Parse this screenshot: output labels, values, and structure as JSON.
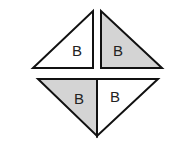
{
  "diagram": {
    "title": "",
    "colors": {
      "stroke": "#111111",
      "shaded": "#d4d4d4",
      "unshaded": "#ffffff"
    },
    "triangles": [
      {
        "position": "top-left",
        "label": "B",
        "shaded": false,
        "points": "93,11 93,68 33,68",
        "label_x": 72,
        "label_y": 56
      },
      {
        "position": "top-right",
        "label": "B",
        "shaded": true,
        "points": "101,11 101,68 162,68",
        "label_x": 113,
        "label_y": 56
      },
      {
        "position": "bottom-left",
        "label": "B",
        "shaded": true,
        "points": "38,79 97,79 97,136",
        "label_x": 74,
        "label_y": 104
      },
      {
        "position": "bottom-right",
        "label": "B",
        "shaded": false,
        "points": "97,79 158,79 97,136",
        "label_x": 110,
        "label_y": 102
      }
    ]
  }
}
